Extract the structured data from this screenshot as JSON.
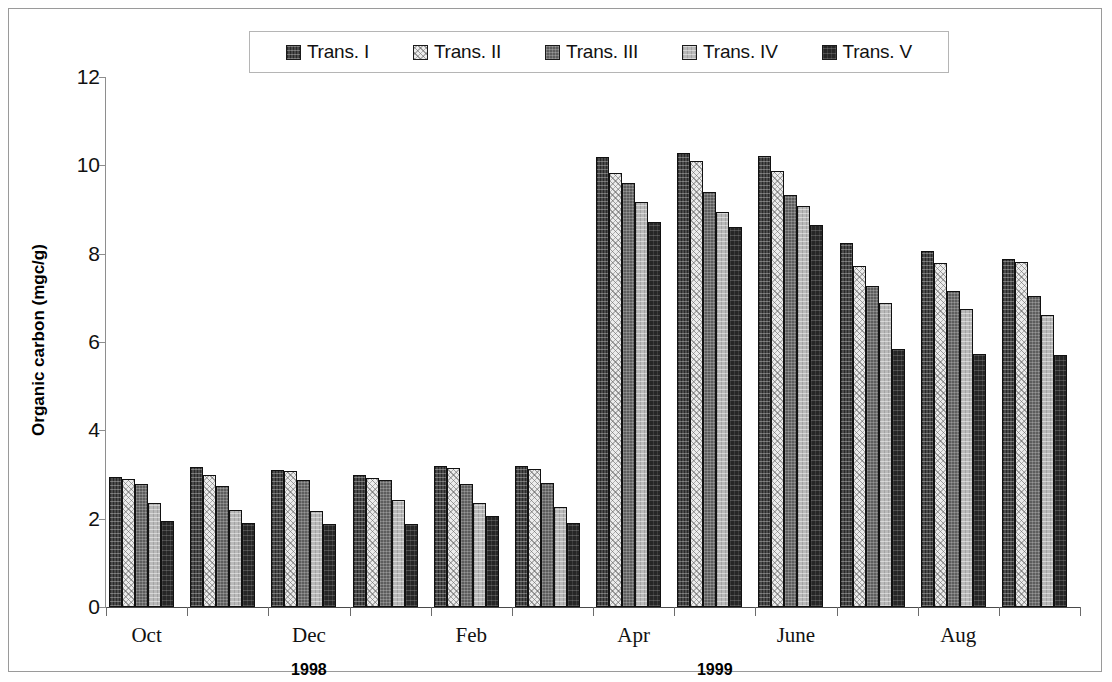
{
  "chart_data": {
    "type": "bar",
    "title": "",
    "xlabel": "",
    "ylabel": "Organic carbon (mgc/g)",
    "ylim": [
      0,
      12
    ],
    "yticks": [
      0,
      2,
      4,
      6,
      8,
      10,
      12
    ],
    "grid": false,
    "legend_position": "top-center",
    "categories": [
      "Oct",
      "Nov",
      "Dec",
      "Jan",
      "Feb",
      "Mar",
      "Apr",
      "May",
      "June",
      "Jul",
      "Aug",
      "Sep"
    ],
    "visible_tick_labels": [
      "Oct",
      "",
      "Dec",
      "",
      "Feb",
      "",
      "Apr",
      "",
      "June",
      "",
      "Aug",
      ""
    ],
    "annotations": [
      {
        "text": "1998",
        "category_span": [
          "Oct",
          "Dec"
        ],
        "position_index": 2
      },
      {
        "text": "1999",
        "category_span": [
          "Jan",
          "Sep"
        ],
        "position_index": 7
      }
    ],
    "series": [
      {
        "name": "Trans. I",
        "color": "#4a4a4a",
        "pattern": "cross-hatch-dark",
        "values": [
          2.94,
          3.18,
          3.1,
          3.0,
          3.2,
          3.19,
          10.2,
          10.27,
          10.22,
          8.25,
          8.05,
          7.88
        ]
      },
      {
        "name": "Trans. II",
        "color": "#ececec",
        "pattern": "fine-diagonal-light",
        "values": [
          2.9,
          3.0,
          3.07,
          2.93,
          3.15,
          3.13,
          9.82,
          10.1,
          9.87,
          7.72,
          7.8,
          7.82
        ]
      },
      {
        "name": "Trans. III",
        "color": "#5d5d5d",
        "pattern": "dotted-medium-dark",
        "values": [
          2.78,
          2.74,
          2.87,
          2.88,
          2.78,
          2.8,
          9.6,
          9.4,
          9.32,
          7.27,
          7.15,
          7.05
        ]
      },
      {
        "name": "Trans. IV",
        "color": "#b9b9b9",
        "pattern": "dotted-light-gray",
        "values": [
          2.35,
          2.2,
          2.18,
          2.42,
          2.35,
          2.26,
          9.18,
          8.95,
          9.08,
          6.88,
          6.75,
          6.62
        ]
      },
      {
        "name": "Trans. V",
        "color": "#262626",
        "pattern": "solid-black",
        "values": [
          1.95,
          1.9,
          1.88,
          1.88,
          2.05,
          1.9,
          8.72,
          8.6,
          8.65,
          5.85,
          5.72,
          5.7
        ]
      }
    ]
  },
  "legend": {
    "items": [
      {
        "label": "Trans. I"
      },
      {
        "label": "Trans. II"
      },
      {
        "label": "Trans. III"
      },
      {
        "label": "Trans. IV"
      },
      {
        "label": "Trans. V"
      }
    ]
  }
}
